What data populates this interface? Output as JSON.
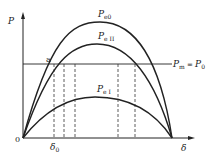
{
  "diagram": {
    "type": "power-angle-characteristics",
    "axes": {
      "y_label": "P",
      "x_label": "δ",
      "origin_label": "0"
    },
    "curves": [
      {
        "id": "pe0",
        "label_main": "P",
        "label_sub": "e0",
        "peak_x": 100,
        "peak_y": 22
      },
      {
        "id": "peII",
        "label_main": "P",
        "label_sub": "e II",
        "peak_x": 97,
        "peak_y": 44
      },
      {
        "id": "peI",
        "label_main": "P",
        "label_sub": "e I",
        "peak_x": 95,
        "peak_y": 97
      }
    ],
    "mechanical_power_line": {
      "label_left": "P",
      "label_left_sub": "m",
      "label_eq": " = ",
      "label_right": "P",
      "label_right_sub": "0"
    },
    "operating_point": {
      "label": "a"
    },
    "delta0": {
      "label_main": "δ",
      "label_sub": "0"
    },
    "colors": {
      "line": "#222222",
      "background": "#ffffff"
    }
  }
}
